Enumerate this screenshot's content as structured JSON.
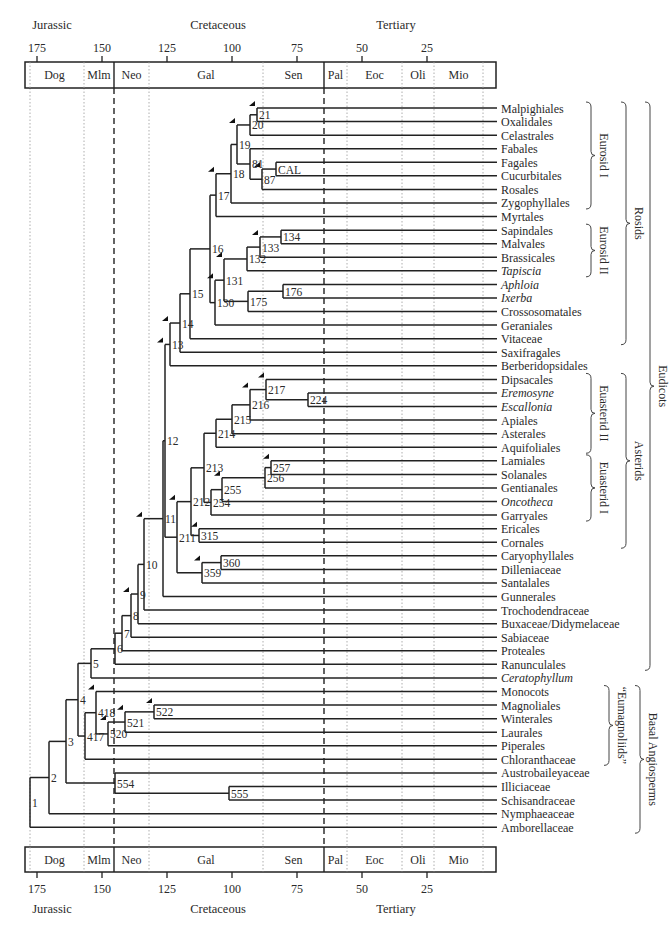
{
  "axis": {
    "scale": {
      "t175_x": 37,
      "px_per_myr": 2.6
    },
    "ticks": [
      175,
      150,
      125,
      100,
      75,
      50,
      25
    ],
    "periods": [
      {
        "label": "Jurassic",
        "x": 52
      },
      {
        "label": "Cretaceous",
        "x": 218
      },
      {
        "label": "Tertiary",
        "x": 396
      }
    ],
    "epochs": [
      {
        "label": "Dog",
        "x0": 25,
        "x1": 84
      },
      {
        "label": "Mlm",
        "x0": 84,
        "x1": 114
      },
      {
        "label": "Neo",
        "x0": 114,
        "x1": 149
      },
      {
        "label": "Gal",
        "x0": 149,
        "x1": 263
      },
      {
        "label": "Sen",
        "x0": 263,
        "x1": 324
      },
      {
        "label": "Pal",
        "x0": 324,
        "x1": 347
      },
      {
        "label": "Eoc",
        "x0": 347,
        "x1": 402
      },
      {
        "label": "Oli",
        "x0": 402,
        "x1": 434
      },
      {
        "label": "Mio",
        "x0": 434,
        "x1": 483
      },
      {
        "label": "",
        "x0": 483,
        "x1": 496
      }
    ],
    "dashed_boundaries": [
      114,
      324
    ],
    "dotted_boundaries": [
      30,
      84,
      149,
      263,
      347,
      402,
      434,
      483
    ]
  },
  "taxa": [
    {
      "name": "Malpighiales",
      "italic": false
    },
    {
      "name": "Oxalidales",
      "italic": false
    },
    {
      "name": "Celastrales",
      "italic": false
    },
    {
      "name": "Fabales",
      "italic": false
    },
    {
      "name": "Fagales",
      "italic": false
    },
    {
      "name": "Cucurbitales",
      "italic": false
    },
    {
      "name": "Rosales",
      "italic": false
    },
    {
      "name": "Zygophyllales",
      "italic": false
    },
    {
      "name": "Myrtales",
      "italic": false
    },
    {
      "name": "Sapindales",
      "italic": false
    },
    {
      "name": "Malvales",
      "italic": false
    },
    {
      "name": "Brassicales",
      "italic": false
    },
    {
      "name": "Tapiscia",
      "italic": true
    },
    {
      "name": "Aphloia",
      "italic": true
    },
    {
      "name": "Ixerba",
      "italic": true
    },
    {
      "name": "Crossosomatales",
      "italic": false
    },
    {
      "name": "Geraniales",
      "italic": false
    },
    {
      "name": "Vitaceae",
      "italic": false
    },
    {
      "name": "Saxifragales",
      "italic": false
    },
    {
      "name": "Berberidopsidales",
      "italic": false
    },
    {
      "name": "Dipsacales",
      "italic": false
    },
    {
      "name": "Eremosyne",
      "italic": true
    },
    {
      "name": "Escallonia",
      "italic": true
    },
    {
      "name": "Apiales",
      "italic": false
    },
    {
      "name": "Asterales",
      "italic": false
    },
    {
      "name": "Aquifoliales",
      "italic": false
    },
    {
      "name": "Lamiales",
      "italic": false
    },
    {
      "name": "Solanales",
      "italic": false
    },
    {
      "name": "Gentianales",
      "italic": false
    },
    {
      "name": "Oncotheca",
      "italic": true
    },
    {
      "name": "Garryales",
      "italic": false
    },
    {
      "name": "Ericales",
      "italic": false
    },
    {
      "name": "Cornales",
      "italic": false
    },
    {
      "name": "Caryophyllales",
      "italic": false
    },
    {
      "name": "Dilleniaceae",
      "italic": false
    },
    {
      "name": "Santalales",
      "italic": false
    },
    {
      "name": "Gunnerales",
      "italic": false
    },
    {
      "name": "Trochodendraceae",
      "italic": false
    },
    {
      "name": "Buxaceae/Didymelaceae",
      "italic": false
    },
    {
      "name": "Sabiaceae",
      "italic": false
    },
    {
      "name": "Proteales",
      "italic": false
    },
    {
      "name": "Ranunculales",
      "italic": false
    },
    {
      "name": "Ceratophyllum",
      "italic": true
    },
    {
      "name": "Monocots",
      "italic": false
    },
    {
      "name": "Magnoliales",
      "italic": false
    },
    {
      "name": "Winterales",
      "italic": false
    },
    {
      "name": "Laurales",
      "italic": false
    },
    {
      "name": "Piperales",
      "italic": false
    },
    {
      "name": "Chloranthaceae",
      "italic": false
    },
    {
      "name": "Austrobaileyaceae",
      "italic": false
    },
    {
      "name": "Illiciaceae",
      "italic": false
    },
    {
      "name": "Schisandraceae",
      "italic": false
    },
    {
      "name": "Nymphaeaceae",
      "italic": false
    },
    {
      "name": "Amborellaceae",
      "italic": false
    }
  ],
  "nodes": [
    {
      "id": "1",
      "x": 30,
      "children": [
        "2",
        53
      ],
      "arrow": false
    },
    {
      "id": "2",
      "x": 49,
      "children": [
        "3",
        52
      ],
      "arrow": false
    },
    {
      "id": "3",
      "x": 66,
      "children": [
        "4",
        "554"
      ],
      "arrow": false
    },
    {
      "id": "554",
      "x": 115,
      "children": [
        49,
        "555"
      ],
      "arrow": false
    },
    {
      "id": "555",
      "x": 229,
      "children": [
        50,
        51
      ],
      "arrow": false
    },
    {
      "id": "4",
      "x": 78,
      "children": [
        "5",
        "417"
      ],
      "arrow": false
    },
    {
      "id": "417",
      "x": 85,
      "children": [
        "418",
        48
      ],
      "arrow": false
    },
    {
      "id": "418",
      "x": 96,
      "children": [
        43,
        "520"
      ],
      "arrow": true
    },
    {
      "id": "520",
      "x": 108,
      "children": [
        "521",
        47
      ],
      "arrow": true
    },
    {
      "id": "521",
      "x": 125,
      "children": [
        "522",
        46
      ],
      "arrow": true
    },
    {
      "id": "522",
      "x": 154,
      "children": [
        44,
        45
      ],
      "arrow": true
    },
    {
      "id": "5",
      "x": 91,
      "children": [
        "6",
        42
      ],
      "arrow": false
    },
    {
      "id": "6",
      "x": 115,
      "children": [
        "7",
        41
      ],
      "arrow": false
    },
    {
      "id": "7",
      "x": 122,
      "children": [
        "8",
        40
      ],
      "arrow": false
    },
    {
      "id": "8",
      "x": 131,
      "children": [
        "9",
        39
      ],
      "arrow": true
    },
    {
      "id": "9",
      "x": 138,
      "children": [
        "10",
        38
      ],
      "arrow": false
    },
    {
      "id": "10",
      "x": 144,
      "children": [
        "11",
        37
      ],
      "arrow": true
    },
    {
      "id": "11",
      "x": 163,
      "children": [
        "12",
        36
      ],
      "arrow": false
    },
    {
      "id": "12",
      "x": 165,
      "children": [
        "13",
        "211"
      ],
      "arrow": true
    },
    {
      "id": "211",
      "x": 177,
      "children": [
        "212",
        "359"
      ],
      "arrow": true
    },
    {
      "id": "359",
      "x": 202,
      "children": [
        "360",
        35
      ],
      "arrow": true
    },
    {
      "id": "360",
      "x": 221,
      "children": [
        33,
        34
      ],
      "arrow": false
    },
    {
      "id": "212",
      "x": 191,
      "children": [
        "213",
        "315"
      ],
      "arrow": false
    },
    {
      "id": "315",
      "x": 199,
      "children": [
        31,
        32
      ],
      "arrow": true
    },
    {
      "id": "213",
      "x": 204,
      "children": [
        "214",
        "254"
      ],
      "arrow": false
    },
    {
      "id": "254",
      "x": 211,
      "children": [
        "255",
        30
      ],
      "arrow": false
    },
    {
      "id": "255",
      "x": 222,
      "children": [
        "256",
        29
      ],
      "arrow": true
    },
    {
      "id": "256",
      "x": 265,
      "children": [
        "257",
        28
      ],
      "arrow": false
    },
    {
      "id": "257",
      "x": 271,
      "children": [
        26,
        27
      ],
      "arrow": true
    },
    {
      "id": "214",
      "x": 216,
      "children": [
        "215",
        25
      ],
      "arrow": false
    },
    {
      "id": "215",
      "x": 232,
      "children": [
        "216",
        24
      ],
      "arrow": false
    },
    {
      "id": "216",
      "x": 250,
      "children": [
        "217",
        23
      ],
      "arrow": true
    },
    {
      "id": "217",
      "x": 266,
      "children": [
        20,
        "224"
      ],
      "arrow": true
    },
    {
      "id": "224",
      "x": 308,
      "children": [
        21,
        22
      ],
      "arrow": false
    },
    {
      "id": "13",
      "x": 170,
      "children": [
        "14",
        19
      ],
      "arrow": true
    },
    {
      "id": "14",
      "x": 180,
      "children": [
        "15",
        18
      ],
      "arrow": false
    },
    {
      "id": "15",
      "x": 190,
      "children": [
        "16",
        17
      ],
      "arrow": false
    },
    {
      "id": "16",
      "x": 210,
      "children": [
        "17n",
        "130"
      ],
      "arrow": false
    },
    {
      "id": "130",
      "x": 215,
      "children": [
        "131",
        16
      ],
      "arrow": true
    },
    {
      "id": "131",
      "x": 224,
      "children": [
        "132",
        "175"
      ],
      "arrow": true
    },
    {
      "id": "175",
      "x": 248,
      "children": [
        "176",
        15
      ],
      "arrow": false
    },
    {
      "id": "176",
      "x": 283,
      "children": [
        13,
        14
      ],
      "arrow": false
    },
    {
      "id": "132",
      "x": 247,
      "children": [
        "133",
        12
      ],
      "arrow": false
    },
    {
      "id": "133",
      "x": 260,
      "children": [
        "134",
        11
      ],
      "arrow": true
    },
    {
      "id": "134",
      "x": 281,
      "children": [
        9,
        10
      ],
      "arrow": false
    },
    {
      "id": "17n",
      "label": "17",
      "x": 216,
      "children": [
        "18",
        8
      ],
      "arrow": true
    },
    {
      "id": "18",
      "x": 231,
      "children": [
        "19",
        7
      ],
      "arrow": false
    },
    {
      "id": "19",
      "x": 237,
      "children": [
        "20",
        "81"
      ],
      "arrow": true
    },
    {
      "id": "20",
      "x": 250,
      "children": [
        "21",
        2
      ],
      "arrow": false
    },
    {
      "id": "21",
      "x": 257,
      "children": [
        0,
        1
      ],
      "arrow": true
    },
    {
      "id": "81",
      "x": 250,
      "children": [
        3,
        "87"
      ],
      "arrow": false
    },
    {
      "id": "87",
      "x": 262,
      "children": [
        "CAL",
        6
      ],
      "arrow": true
    },
    {
      "id": "CAL",
      "x": 276,
      "children": [
        4,
        5
      ],
      "arrow": false
    }
  ],
  "brackets": [
    {
      "label": "Eurosid I",
      "from": 0,
      "to": 7,
      "col": 1
    },
    {
      "label": "Eurosid II",
      "from": 9,
      "to": 12,
      "col": 1
    },
    {
      "label": "Euasterid II",
      "from": 20,
      "to": 25,
      "col": 1
    },
    {
      "label": "Euasterid I",
      "from": 26,
      "to": 30,
      "col": 1
    },
    {
      "label": "“Eumagnoliids”",
      "from": 43,
      "to": 48,
      "col": 1.3
    },
    {
      "label": "Rosids",
      "from": 0,
      "to": 17,
      "col": 2
    },
    {
      "label": "Asterids",
      "from": 20,
      "to": 32,
      "col": 2
    },
    {
      "label": "Basal Angiosperms",
      "from": 43,
      "to": 53,
      "col": 2.3
    },
    {
      "label": "Eudicots",
      "from": 0,
      "to": 41,
      "col": 3
    }
  ]
}
